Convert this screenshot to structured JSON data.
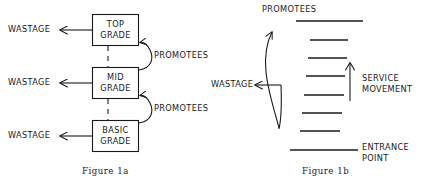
{
  "figure": {
    "background_color": "#ffffff",
    "ink_color": "#1a1a1a",
    "panels": [
      {
        "id": "figure-1a",
        "caption": "Figure 1a",
        "kind": "box-and-arrow-flow-diagram",
        "boxes": [
          {
            "id": "top-grade",
            "line1": "TOP",
            "line2": "GRADE"
          },
          {
            "id": "mid-grade",
            "line1": "MID",
            "line2": "GRADE"
          },
          {
            "id": "basic-grade",
            "line1": "BASIC",
            "line2": "GRADE"
          }
        ],
        "wastage_labels": [
          "WASTAGE",
          "WASTAGE",
          "WASTAGE"
        ],
        "promotee_labels": [
          "PROMOTEES",
          "PROMOTEES"
        ]
      },
      {
        "id": "figure-1b",
        "caption": "Figure 1b",
        "kind": "grade-ladder-diagram",
        "promotees_label": "PROMOTEES",
        "wastage_label": "WASTAGE",
        "service_movement_label_line1": "SERVICE",
        "service_movement_label_line2": "MOVEMENT",
        "entrance_point_label_line1": "ENTRANCE",
        "entrance_point_label_line2": "POINT",
        "ladder_rungs_count": 8,
        "long_rungs": 2,
        "short_rungs": 6
      }
    ]
  },
  "panel_a": {
    "box_top_line1": "TOP",
    "box_top_line2": "GRADE",
    "box_mid_line1": "MID",
    "box_mid_line2": "GRADE",
    "box_basic_line1": "BASIC",
    "box_basic_line2": "GRADE",
    "wastage_top": "WASTAGE",
    "wastage_mid": "WASTAGE",
    "wastage_basic": "WASTAGE",
    "promotees_upper": "PROMOTEES",
    "promotees_lower": "PROMOTEES",
    "caption": "Figure 1a"
  },
  "panel_b": {
    "promotees": "PROMOTEES",
    "wastage": "WASTAGE",
    "service_movement_line1": "SERVICE",
    "service_movement_line2": "MOVEMENT",
    "entrance_point_line1": "ENTRANCE",
    "entrance_point_line2": "POINT",
    "caption": "Figure 1b"
  }
}
